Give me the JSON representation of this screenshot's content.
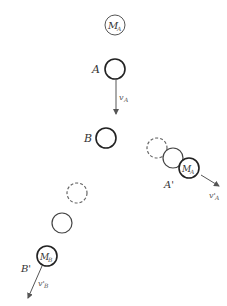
{
  "diagram": {
    "type": "collision-trajectory",
    "colors": {
      "stroke": "#333333",
      "dashed": "#666666",
      "arrow": "#555555"
    },
    "labels": {
      "mass_a": "M",
      "mass_a_sub": "A",
      "ball_a": "A",
      "velocity_a": "v",
      "velocity_a_sub": "A",
      "ball_b": "B",
      "ball_a_after": "A'",
      "mass_a_after": "M",
      "mass_a_after_sub": "A",
      "velocity_a_after": "v'",
      "velocity_a_after_sub": "A",
      "ball_b_after": "B'",
      "mass_b_after": "M",
      "mass_b_after_sub": "B",
      "velocity_b_after": "v'",
      "velocity_b_after_sub": "B"
    }
  }
}
